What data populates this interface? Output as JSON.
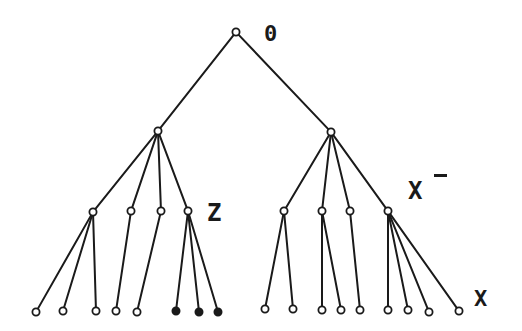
{
  "diagram": {
    "type": "rooted-tree",
    "labels": {
      "root": "0",
      "z": "Z",
      "x_minus_base": "X",
      "x_minus_sup": "−",
      "x": "X"
    },
    "colors": {
      "stroke": "#1a1a1a",
      "background": "#ffffff",
      "hollow_fill": "#ffffff",
      "filled_fill": "#1a1a1a"
    },
    "nodes": [
      {
        "id": "root",
        "x": 236,
        "y": 32,
        "filled": false
      },
      {
        "id": "L",
        "x": 158,
        "y": 131,
        "filled": false
      },
      {
        "id": "R",
        "x": 331,
        "y": 132,
        "filled": false
      },
      {
        "id": "L1",
        "x": 93,
        "y": 212,
        "filled": false
      },
      {
        "id": "L2",
        "x": 131,
        "y": 211,
        "filled": false
      },
      {
        "id": "L3",
        "x": 161,
        "y": 211,
        "filled": false
      },
      {
        "id": "L4",
        "x": 188,
        "y": 211,
        "filled": false
      },
      {
        "id": "R1",
        "x": 284,
        "y": 211,
        "filled": false
      },
      {
        "id": "R2",
        "x": 322,
        "y": 211,
        "filled": false
      },
      {
        "id": "R3",
        "x": 350,
        "y": 211,
        "filled": false
      },
      {
        "id": "R4",
        "x": 388,
        "y": 211,
        "filled": false
      },
      {
        "id": "a1",
        "x": 36,
        "y": 312,
        "filled": false
      },
      {
        "id": "a2",
        "x": 63,
        "y": 311,
        "filled": false
      },
      {
        "id": "a3",
        "x": 96,
        "y": 311,
        "filled": false
      },
      {
        "id": "b1",
        "x": 116,
        "y": 311,
        "filled": false
      },
      {
        "id": "c1",
        "x": 137,
        "y": 312,
        "filled": false
      },
      {
        "id": "d1",
        "x": 176,
        "y": 311,
        "filled": true
      },
      {
        "id": "d2",
        "x": 199,
        "y": 312,
        "filled": true
      },
      {
        "id": "d3",
        "x": 218,
        "y": 312,
        "filled": true
      },
      {
        "id": "e1",
        "x": 265,
        "y": 309,
        "filled": false
      },
      {
        "id": "e2",
        "x": 293,
        "y": 309,
        "filled": false
      },
      {
        "id": "f1",
        "x": 322,
        "y": 310,
        "filled": false
      },
      {
        "id": "f2",
        "x": 341,
        "y": 310,
        "filled": false
      },
      {
        "id": "g1",
        "x": 360,
        "y": 310,
        "filled": false
      },
      {
        "id": "h1",
        "x": 388,
        "y": 310,
        "filled": false
      },
      {
        "id": "h2",
        "x": 408,
        "y": 310,
        "filled": false
      },
      {
        "id": "h3",
        "x": 429,
        "y": 312,
        "filled": false
      },
      {
        "id": "h4",
        "x": 459,
        "y": 311,
        "filled": false
      }
    ],
    "edges": [
      [
        "root",
        "L"
      ],
      [
        "root",
        "R"
      ],
      [
        "L",
        "L1"
      ],
      [
        "L",
        "L2"
      ],
      [
        "L",
        "L3"
      ],
      [
        "L",
        "L4"
      ],
      [
        "R",
        "R1"
      ],
      [
        "R",
        "R2"
      ],
      [
        "R",
        "R3"
      ],
      [
        "R",
        "R4"
      ],
      [
        "L1",
        "a1"
      ],
      [
        "L1",
        "a2"
      ],
      [
        "L1",
        "a3"
      ],
      [
        "L2",
        "b1"
      ],
      [
        "L3",
        "c1"
      ],
      [
        "L4",
        "d1"
      ],
      [
        "L4",
        "d2"
      ],
      [
        "L4",
        "d3"
      ],
      [
        "R1",
        "e1"
      ],
      [
        "R1",
        "e2"
      ],
      [
        "R2",
        "f1"
      ],
      [
        "R2",
        "f2"
      ],
      [
        "R3",
        "g1"
      ],
      [
        "R4",
        "h1"
      ],
      [
        "R4",
        "h2"
      ],
      [
        "R4",
        "h3"
      ],
      [
        "R4",
        "h4"
      ]
    ]
  }
}
